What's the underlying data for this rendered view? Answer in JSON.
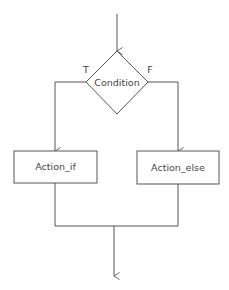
{
  "diagram": {
    "type": "flowchart",
    "decision": {
      "label": "Condition"
    },
    "branches": {
      "true_label": "T",
      "false_label": "F"
    },
    "actions": [
      {
        "id": "action-if",
        "label": "Action_if"
      },
      {
        "id": "action-else",
        "label": "Action_else"
      }
    ],
    "colors": {
      "stroke": "#555555",
      "text": "#444444",
      "background": "#ffffff"
    }
  }
}
